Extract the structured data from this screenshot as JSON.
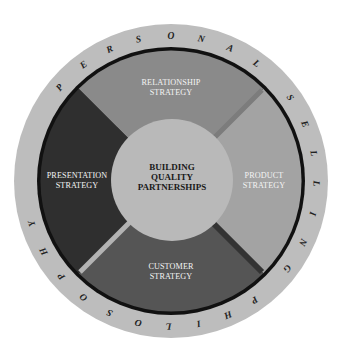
{
  "diagram": {
    "outer_ring_text": "PERSONAL SELLING PHILOSOPHY",
    "center_label": [
      "BUILDING",
      "QUALITY",
      "PARTNERSHIPS"
    ],
    "quadrants": {
      "top": {
        "lines": [
          "RELATIONSHIP",
          "STRATEGY"
        ],
        "color": "#8a8a8a"
      },
      "right": {
        "lines": [
          "PRODUCT",
          "STRATEGY"
        ],
        "color": "#a3a3a3"
      },
      "bottom": {
        "lines": [
          "CUSTOMER",
          "STRATEGY"
        ],
        "color": "#555555"
      },
      "left": {
        "lines": [
          "PRESENTATION",
          "STRATEGY"
        ],
        "color": "#2f2f2f"
      }
    },
    "colors": {
      "outer_ring": "#bdbdbd",
      "black_ring": "#111111",
      "center_circle": "#b9b9b9",
      "gap_upper_right": "#7c7c7c",
      "gap_lower_right": "#333333",
      "gap_lower_left": "#b3b3b3"
    },
    "ring_letters": [
      {
        "ch": "P",
        "angle": 220
      },
      {
        "ch": "E",
        "angle": 233
      },
      {
        "ch": "R",
        "angle": 245
      },
      {
        "ch": "S",
        "angle": 257
      },
      {
        "ch": "O",
        "angle": 270
      },
      {
        "ch": "N",
        "angle": 282
      },
      {
        "ch": "A",
        "angle": 294
      },
      {
        "ch": "L",
        "angle": 306
      },
      {
        "ch": "S",
        "angle": 325
      },
      {
        "ch": "E",
        "angle": 337
      },
      {
        "ch": "L",
        "angle": 349
      },
      {
        "ch": "L",
        "angle": 361
      },
      {
        "ch": "I",
        "angle": 373
      },
      {
        "ch": "N",
        "angle": 385
      },
      {
        "ch": "G",
        "angle": 397
      },
      {
        "ch": "P",
        "angle": 415
      },
      {
        "ch": "H",
        "angle": 427
      },
      {
        "ch": "I",
        "angle": 439
      },
      {
        "ch": "L",
        "angle": 451
      },
      {
        "ch": "O",
        "angle": 463
      },
      {
        "ch": "S",
        "angle": 475
      },
      {
        "ch": "O",
        "angle": 487
      },
      {
        "ch": "P",
        "angle": 499
      },
      {
        "ch": "H",
        "angle": 511
      },
      {
        "ch": "Y",
        "angle": 523
      }
    ]
  }
}
